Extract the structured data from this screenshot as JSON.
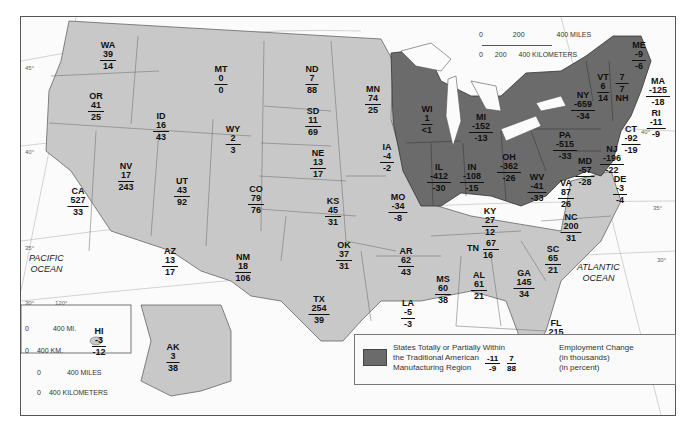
{
  "legend": {
    "region_label_lines": [
      "States Totally or Partially Within",
      "the Traditional American",
      "Manufacturing Region"
    ],
    "example": {
      "left": {
        "thousands": "-11",
        "percent": "-9"
      },
      "right": {
        "thousands": "7",
        "percent": "88"
      }
    },
    "units_lines": [
      "Employment Change",
      "(in thousands)",
      "(in percent)"
    ],
    "colors": {
      "manufacturing_region": "#6b6b6b",
      "other_states": "#c8c8c8",
      "water": "#fbfbfb"
    }
  },
  "scale_bar": {
    "miles_ticks": [
      "0",
      "200",
      "400 MILES"
    ],
    "km_ticks": [
      "0",
      "200",
      "400 KILOMETERS"
    ]
  },
  "inset_scales": {
    "hawaii": {
      "miles": [
        "0",
        "400 MI."
      ],
      "km": [
        "0",
        "400 KM."
      ]
    },
    "alaska": {
      "miles": [
        "0",
        "400 MILES"
      ],
      "km": [
        "0",
        "400 KILOMETERS"
      ]
    }
  },
  "oceans": {
    "pacific": [
      "PACIFIC",
      "OCEAN"
    ],
    "atlantic": [
      "ATLANTIC",
      "OCEAN"
    ]
  },
  "graticule": {
    "lat_labels": [
      "45°",
      "40°",
      "35°",
      "30°",
      "40°",
      "35°",
      "30°"
    ],
    "lon_labels": [
      "120°",
      "95°",
      "90°",
      "85°"
    ]
  },
  "states": [
    {
      "abbr": "WA",
      "thousands": "39",
      "percent": "14",
      "manufacturing": false
    },
    {
      "abbr": "OR",
      "thousands": "41",
      "percent": "25",
      "manufacturing": false
    },
    {
      "abbr": "CA",
      "thousands": "527",
      "percent": "33",
      "manufacturing": false
    },
    {
      "abbr": "ID",
      "thousands": "16",
      "percent": "43",
      "manufacturing": false
    },
    {
      "abbr": "NV",
      "thousands": "17",
      "percent": "243",
      "manufacturing": false
    },
    {
      "abbr": "UT",
      "thousands": "43",
      "percent": "92",
      "manufacturing": false
    },
    {
      "abbr": "AZ",
      "thousands": "13",
      "percent": "17",
      "manufacturing": false
    },
    {
      "abbr": "MT",
      "thousands": "0",
      "percent": "0",
      "manufacturing": false
    },
    {
      "abbr": "WY",
      "thousands": "2",
      "percent": "3",
      "manufacturing": false
    },
    {
      "abbr": "CO",
      "thousands": "79",
      "percent": "76",
      "manufacturing": false
    },
    {
      "abbr": "NM",
      "thousands": "18",
      "percent": "106",
      "manufacturing": false
    },
    {
      "abbr": "ND",
      "thousands": "7",
      "percent": "88",
      "manufacturing": false
    },
    {
      "abbr": "SD",
      "thousands": "11",
      "percent": "69",
      "manufacturing": false
    },
    {
      "abbr": "NE",
      "thousands": "13",
      "percent": "17",
      "manufacturing": false
    },
    {
      "abbr": "KS",
      "thousands": "45",
      "percent": "31",
      "manufacturing": false
    },
    {
      "abbr": "OK",
      "thousands": "37",
      "percent": "31",
      "manufacturing": false
    },
    {
      "abbr": "TX",
      "thousands": "254",
      "percent": "39",
      "manufacturing": false
    },
    {
      "abbr": "MN",
      "thousands": "74",
      "percent": "25",
      "manufacturing": false
    },
    {
      "abbr": "IA",
      "thousands": "-4",
      "percent": "-2",
      "manufacturing": false
    },
    {
      "abbr": "MO",
      "thousands": "-34",
      "percent": "-8",
      "manufacturing": false
    },
    {
      "abbr": "AR",
      "thousands": "62",
      "percent": "43",
      "manufacturing": false
    },
    {
      "abbr": "LA",
      "thousands": "-5",
      "percent": "-3",
      "manufacturing": false
    },
    {
      "abbr": "MS",
      "thousands": "60",
      "percent": "38",
      "manufacturing": false
    },
    {
      "abbr": "AL",
      "thousands": "61",
      "percent": "21",
      "manufacturing": false
    },
    {
      "abbr": "TN",
      "thousands": "67",
      "percent": "16",
      "manufacturing": false
    },
    {
      "abbr": "KY",
      "thousands": "27",
      "percent": "12",
      "manufacturing": false
    },
    {
      "abbr": "GA",
      "thousands": "145",
      "percent": "34",
      "manufacturing": false
    },
    {
      "abbr": "FL",
      "thousands": "215",
      "percent": "75",
      "manufacturing": false
    },
    {
      "abbr": "SC",
      "thousands": "65",
      "percent": "21",
      "manufacturing": false
    },
    {
      "abbr": "NC",
      "thousands": "200",
      "percent": "31",
      "manufacturing": false
    },
    {
      "abbr": "VA",
      "thousands": "87",
      "percent": "26",
      "manufacturing": false
    },
    {
      "abbr": "WI",
      "thousands": "1",
      "percent": "<1",
      "manufacturing": true
    },
    {
      "abbr": "MI",
      "thousands": "-152",
      "percent": "-13",
      "manufacturing": true
    },
    {
      "abbr": "IL",
      "thousands": "-412",
      "percent": "-30",
      "manufacturing": true
    },
    {
      "abbr": "IN",
      "thousands": "-108",
      "percent": "-15",
      "manufacturing": true
    },
    {
      "abbr": "OH",
      "thousands": "-362",
      "percent": "-26",
      "manufacturing": true
    },
    {
      "abbr": "WV",
      "thousands": "-41",
      "percent": "-33",
      "manufacturing": true
    },
    {
      "abbr": "PA",
      "thousands": "-515",
      "percent": "-33",
      "manufacturing": true
    },
    {
      "abbr": "NY",
      "thousands": "-659",
      "percent": "-34",
      "manufacturing": true
    },
    {
      "abbr": "MD",
      "thousands": "-57",
      "percent": "-28",
      "manufacturing": true
    },
    {
      "abbr": "VT",
      "thousands": "6",
      "percent": "14",
      "manufacturing": true
    },
    {
      "abbr": "NH",
      "thousands": "7",
      "percent": "7",
      "manufacturing": true
    },
    {
      "abbr": "ME",
      "thousands": "-9",
      "percent": "-6",
      "manufacturing": true
    },
    {
      "abbr": "MA",
      "thousands": "-125",
      "percent": "-18",
      "manufacturing": true
    },
    {
      "abbr": "RI",
      "thousands": "-11",
      "percent": "-9",
      "manufacturing": true
    },
    {
      "abbr": "CT",
      "thousands": "-92",
      "percent": "-19",
      "manufacturing": true
    },
    {
      "abbr": "NJ",
      "thousands": "-196",
      "percent": "-22",
      "manufacturing": true
    },
    {
      "abbr": "DE",
      "thousands": "-3",
      "percent": "-4",
      "manufacturing": true
    },
    {
      "abbr": "HI",
      "thousands": "-3",
      "percent": "-12",
      "manufacturing": false
    },
    {
      "abbr": "AK",
      "thousands": "3",
      "percent": "38",
      "manufacturing": false
    }
  ]
}
